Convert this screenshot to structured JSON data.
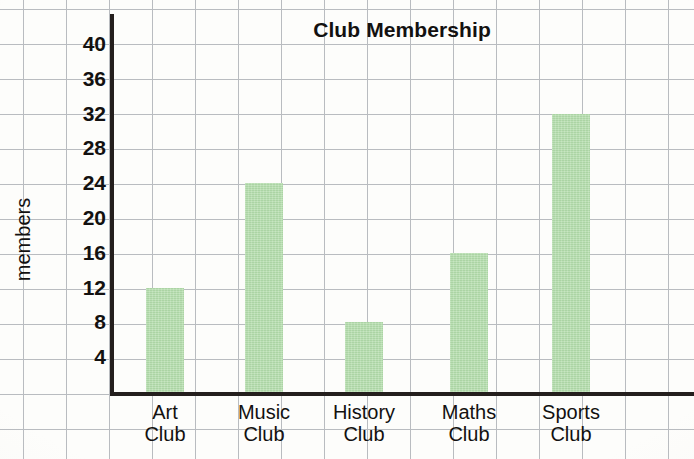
{
  "chart_data": {
    "type": "bar",
    "title": "Club Membership",
    "xlabel": "",
    "ylabel": "members",
    "categories": [
      "Art Club",
      "Music Club",
      "History Club",
      "Maths Club",
      "Sports Club"
    ],
    "category_lines": [
      [
        "Art",
        "Club"
      ],
      [
        "Music",
        "Club"
      ],
      [
        "History",
        "Club"
      ],
      [
        "Maths",
        "Club"
      ],
      [
        "Sports",
        "Club"
      ]
    ],
    "values": [
      12,
      24,
      8,
      16,
      32
    ],
    "ylim": [
      0,
      44
    ],
    "y_tick_labels": [
      "4",
      "8",
      "12",
      "16",
      "20",
      "24",
      "28",
      "32",
      "36",
      "40"
    ],
    "y_tick_values": [
      4,
      8,
      12,
      16,
      20,
      24,
      28,
      32,
      36,
      40
    ],
    "y_tick_interval": 4,
    "grid": true,
    "legend": false,
    "bar_color": "#b3ddab",
    "axis_color": "#241f1d",
    "grid_color": "#b9bcc0",
    "text_color": "#131110",
    "background": "#fdfdfb"
  },
  "layout": {
    "grid_spacing_x": 43,
    "grid_spacing_y": 35,
    "grid_origin_x": 23,
    "grid_origin_y": 9,
    "axis_x_px": 110,
    "baseline_y_px": 392,
    "pixels_per_unit": 8.7,
    "bar_width_px": 38,
    "bar_left_positions": [
      146,
      245,
      345,
      450,
      552
    ]
  }
}
